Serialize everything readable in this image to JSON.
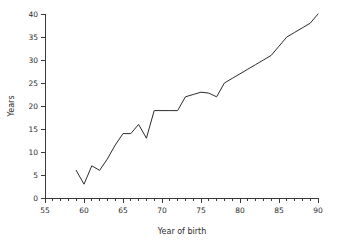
{
  "chart_data": {
    "type": "line",
    "title": "",
    "xlabel": "Year of birth",
    "ylabel": "Years",
    "xlim": [
      55,
      90
    ],
    "ylim": [
      0,
      40
    ],
    "grid": false,
    "legend": null,
    "x_ticks_major": [
      55,
      60,
      65,
      70,
      75,
      80,
      85,
      90
    ],
    "x_tick_labels": [
      "55",
      "60",
      "65",
      "70",
      "75",
      "80",
      "85",
      "90"
    ],
    "x_ticks_minor_step": 1,
    "y_ticks_major": [
      0,
      5,
      10,
      15,
      20,
      25,
      30,
      35,
      40
    ],
    "y_tick_labels": [
      "0",
      "5",
      "10",
      "15",
      "20",
      "25",
      "30",
      "35",
      "40"
    ],
    "line_color": "#2b2b2b",
    "x": [
      59,
      60,
      61,
      62,
      63,
      64,
      65,
      66,
      67,
      68,
      69,
      70,
      71,
      72,
      73,
      74,
      75,
      76,
      77,
      78,
      79,
      80,
      81,
      82,
      83,
      84,
      85,
      86,
      87,
      88,
      89,
      90
    ],
    "values": [
      6,
      3,
      7,
      6,
      8.5,
      11.5,
      14,
      14,
      16,
      13,
      19,
      19,
      19,
      19,
      22,
      22.5,
      23,
      22.8,
      22,
      25,
      26,
      27,
      28,
      29,
      30,
      31,
      33,
      35,
      36,
      37,
      38,
      40
    ],
    "series": [
      {
        "name": "Years",
        "values": [
          6,
          3,
          7,
          6,
          8.5,
          11.5,
          14,
          14,
          16,
          13,
          19,
          19,
          19,
          19,
          22,
          22.5,
          23,
          22.8,
          22,
          25,
          26,
          27,
          28,
          29,
          30,
          31,
          33,
          35,
          36,
          37,
          38,
          40
        ]
      }
    ]
  }
}
